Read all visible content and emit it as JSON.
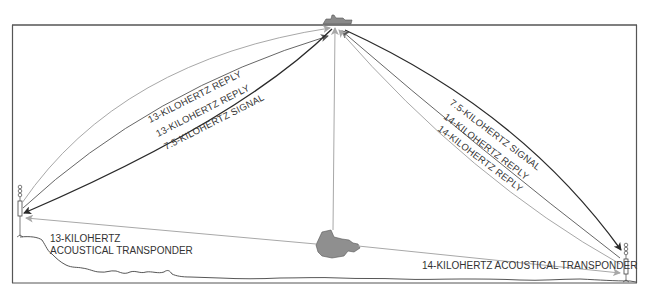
{
  "diagram": {
    "type": "acoustic-navigation-schematic",
    "colors": {
      "frame": "#555555",
      "signal": "#2a2a2a",
      "reply_dark": "#444444",
      "reply_light": "#a8a8a8",
      "vessel_fill": "#8a8a8a",
      "seafloor": "#444444"
    },
    "left_path_labels": {
      "outer": "13-KILOHERTZ REPLY",
      "middle": "13-KILOHERTZ REPLY",
      "inner": "7.5-KILOHERTZ SIGNAL"
    },
    "right_path_labels": {
      "outer": "7.5-KILOHERTZ SIGNAL",
      "middle": "14-KILOHERTZ REPLY",
      "inner": "14-KILOHERTZ REPLY"
    },
    "left_transponder": {
      "line1": "13-KILOHERTZ",
      "line2": "ACOUSTICAL TRANSPONDER"
    },
    "right_transponder": {
      "line1": "14-KILOHERTZ ACOUSTICAL TRANSPONDER"
    },
    "nodes": {
      "surface_ship": "surface ship",
      "submersible": "submersible",
      "left_beacon": "13-kHz transponder",
      "right_beacon": "14-kHz transponder"
    }
  }
}
